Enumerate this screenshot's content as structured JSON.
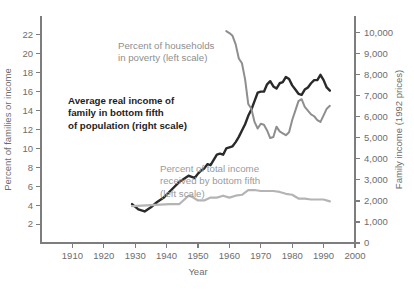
{
  "chart_data": {
    "type": "line",
    "title": "",
    "xlabel": "Year",
    "ylabel_left": "Percent of families or income",
    "ylabel_right": "Family income (1992 prices)",
    "grid": false,
    "legend_position": "inline-annotations",
    "xlim": [
      1900,
      2000
    ],
    "xticks": [
      1910,
      1920,
      1930,
      1940,
      1950,
      1960,
      1970,
      1980,
      1990,
      2000
    ],
    "xtick_labels": [
      "1910",
      "1920",
      "1930",
      "1940",
      "1950",
      "1960",
      "1970",
      "1980",
      "1990",
      "2000"
    ],
    "ylim_left": [
      0,
      24
    ],
    "yticks_left": [
      2,
      4,
      6,
      8,
      10,
      12,
      14,
      16,
      18,
      20,
      22
    ],
    "ytick_labels_left": [
      "2",
      "4",
      "6",
      "8",
      "10",
      "12",
      "14",
      "16",
      "18",
      "20",
      "22"
    ],
    "ylim_right": [
      0,
      10800
    ],
    "yticks_right": [
      0,
      1000,
      2000,
      3000,
      4000,
      5000,
      6000,
      7000,
      8000,
      9000,
      10000
    ],
    "ytick_labels_right": [
      "0",
      "1,000",
      "2,000",
      "3,000",
      "4,000",
      "5,000",
      "6,000",
      "7,000",
      "8,000",
      "9,000",
      "10,000"
    ],
    "series": [
      {
        "name": "Average real income of family in bottom fifth of population (right scale)",
        "axis": "right",
        "color": "#2a2a2a",
        "x": [
          1929,
          1931,
          1933,
          1935,
          1937,
          1939,
          1941,
          1944,
          1947,
          1948,
          1949,
          1950,
          1951,
          1952,
          1953,
          1954,
          1955,
          1956,
          1957,
          1958,
          1959,
          1960,
          1961,
          1962,
          1963,
          1964,
          1965,
          1966,
          1967,
          1968,
          1969,
          1970,
          1971,
          1972,
          1973,
          1974,
          1975,
          1976,
          1977,
          1978,
          1979,
          1980,
          1981,
          1982,
          1983,
          1984,
          1985,
          1986,
          1987,
          1988,
          1989,
          1990,
          1991,
          1992
        ],
        "y": [
          1850,
          1600,
          1500,
          1700,
          1950,
          2150,
          2450,
          2900,
          3200,
          3150,
          3100,
          3300,
          3450,
          3550,
          3750,
          3700,
          3950,
          4200,
          4250,
          4200,
          4500,
          4550,
          4600,
          4800,
          5050,
          5350,
          5650,
          6050,
          6350,
          6750,
          7150,
          7200,
          7200,
          7550,
          7700,
          7450,
          7350,
          7600,
          7650,
          7900,
          7800,
          7500,
          7300,
          7100,
          7050,
          7300,
          7400,
          7600,
          7750,
          7750,
          8000,
          7750,
          7400,
          7250
        ],
        "y_display_note": "black line, right scale, 1992 dollars"
      },
      {
        "name": "Percent of households in poverty (left scale)",
        "axis": "left",
        "color": "#8e8e8e",
        "x": [
          1959,
          1960,
          1961,
          1962,
          1963,
          1964,
          1965,
          1966,
          1967,
          1968,
          1969,
          1970,
          1971,
          1972,
          1973,
          1974,
          1975,
          1976,
          1977,
          1978,
          1979,
          1980,
          1981,
          1982,
          1983,
          1984,
          1985,
          1986,
          1987,
          1988,
          1989,
          1990,
          1991,
          1992
        ],
        "y": [
          22.4,
          22.2,
          21.9,
          21.0,
          19.5,
          19.0,
          17.3,
          14.7,
          14.2,
          12.8,
          12.1,
          12.6,
          12.5,
          11.9,
          11.1,
          11.2,
          12.3,
          11.8,
          11.6,
          11.4,
          11.7,
          13.0,
          14.0,
          15.0,
          15.2,
          14.4,
          14.0,
          13.6,
          13.4,
          13.0,
          12.8,
          13.5,
          14.2,
          14.5
        ],
        "y_display_note": "medium gray descending line, left scale, percent"
      },
      {
        "name": "Percent of total income received by bottom fifth (left scale)",
        "axis": "left",
        "color": "#b4b4b4",
        "x": [
          1929,
          1935,
          1941,
          1944,
          1947,
          1948,
          1950,
          1952,
          1954,
          1956,
          1958,
          1960,
          1962,
          1964,
          1966,
          1968,
          1970,
          1972,
          1974,
          1976,
          1978,
          1980,
          1982,
          1984,
          1986,
          1988,
          1990,
          1992
        ],
        "y": [
          3.9,
          4.0,
          4.1,
          4.1,
          5.0,
          4.9,
          4.5,
          4.5,
          4.8,
          4.8,
          5.0,
          4.8,
          5.0,
          5.1,
          5.6,
          5.6,
          5.5,
          5.5,
          5.5,
          5.4,
          5.2,
          5.1,
          4.7,
          4.7,
          4.6,
          4.6,
          4.6,
          4.4
        ],
        "y_display_note": "light gray flat line near bottom, left scale, percent"
      }
    ],
    "annotations": [
      {
        "id": "poverty-label",
        "text": "Percent of households\nin poverty (left scale)",
        "color": "#8e8e8e",
        "style": "normal"
      },
      {
        "id": "income-label",
        "text": "Average real income of\nfamily in bottom fifth\nof population (right scale)",
        "color": "#1d1d1d",
        "style": "bold"
      },
      {
        "id": "share-label",
        "text": "Percent of total income\nreceived by bottom fifth\n(left scale)",
        "color": "#9a9a9a",
        "style": "normal"
      }
    ]
  },
  "annotations_text": {
    "poverty_line1": "Percent of households",
    "poverty_line2": "in poverty (left scale)",
    "income_line1": "Average real income of",
    "income_line2": "family in bottom fifth",
    "income_line3": "of population (right scale)",
    "share_line1": "Percent of total income",
    "share_line2": "received by bottom fifth",
    "share_line3": "(left scale)"
  }
}
